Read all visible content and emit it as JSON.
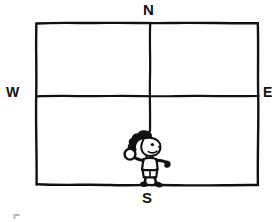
{
  "figure": {
    "type": "hand-drawn-diagram",
    "background_color": "#ffffff",
    "ink_color": "#111111",
    "canvas": {
      "width": 274,
      "height": 222
    }
  },
  "compass": {
    "north_label": "N",
    "south_label": "S",
    "west_label": "W",
    "east_label": "E"
  },
  "field": {
    "border": {
      "left": 36,
      "top": 23,
      "right": 258,
      "bottom": 185
    },
    "horizontal_divider_y": 96,
    "vertical_divider_x": 150,
    "vertical_divider_top": 23,
    "vertical_divider_bottom": 131,
    "quadrant_count": 4
  },
  "character": {
    "name": "child-figure",
    "description": "cartoon child with curly hair holding a ball, standing on the south edge",
    "position": {
      "x": 146,
      "y": 158
    },
    "holds": "ball",
    "standing_on": "south-border-line"
  },
  "artifacts": {
    "corner_mark": "scan-artifact-bottom-left"
  }
}
